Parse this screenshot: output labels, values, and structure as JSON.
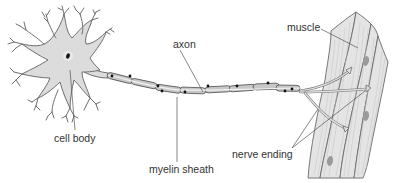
{
  "diagram": {
    "labels": {
      "cell_body": "cell body",
      "axon": "axon",
      "myelin_sheath": "myelin sheath",
      "nerve_ending": "nerve ending",
      "muscle": "muscle"
    },
    "parts": [
      {
        "id": "cell-body",
        "label": "cell body"
      },
      {
        "id": "axon",
        "label": "axon"
      },
      {
        "id": "myelin-sheath",
        "label": "myelin sheath"
      },
      {
        "id": "nerve-ending",
        "label": "nerve ending"
      },
      {
        "id": "muscle",
        "label": "muscle"
      }
    ],
    "colors": {
      "cell_fill": "#dcdcdc",
      "outline": "#6f6f6f",
      "myelin_fill": "#c8c8c8",
      "muscle_fill": "#e4e4e4",
      "nucleus": "#111111",
      "muscle_nucleus": "#9a9a9a",
      "label_text": "#333333"
    }
  }
}
